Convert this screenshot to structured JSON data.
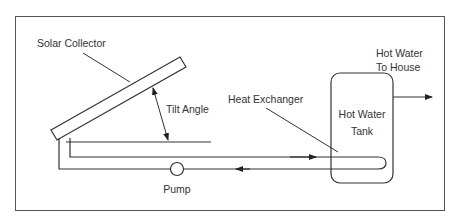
{
  "diagram": {
    "type": "solar water heating system schematic",
    "labels": {
      "solar_collector": "Solar Collector",
      "tilt_angle": "Tilt Angle",
      "heat_exchanger": "Heat Exchanger",
      "tank_line1": "Hot Water",
      "tank_line2": "Tank",
      "output_line1": "Hot Water",
      "output_line2": "To House",
      "pump": "Pump"
    },
    "colors": {
      "stroke": "#333333",
      "frame": "#555555",
      "background": "#ffffff"
    }
  }
}
